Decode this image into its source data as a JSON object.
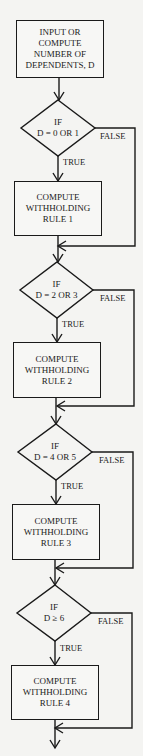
{
  "flowchart": {
    "start_box": {
      "lines": [
        "INPUT OR",
        "COMPUTE",
        "NUMBER OF",
        "DEPENDENTS, D"
      ]
    },
    "decisions": [
      {
        "line1": "IF",
        "line2": "D = 0 OR 1",
        "true_label": "TRUE",
        "false_label": "FALSE"
      },
      {
        "line1": "IF",
        "line2": "D = 2 OR 3",
        "true_label": "TRUE",
        "false_label": "FALSE"
      },
      {
        "line1": "IF",
        "line2": "D = 4 OR 5",
        "true_label": "TRUE",
        "false_label": "FALSE"
      },
      {
        "line1": "IF",
        "line2": "D ≥ 6",
        "true_label": "TRUE",
        "false_label": "FALSE"
      }
    ],
    "process_boxes": [
      {
        "lines": [
          "COMPUTE",
          "WITHHOLDING",
          "RULE 1"
        ]
      },
      {
        "lines": [
          "COMPUTE",
          "WITHHOLDING",
          "RULE 2"
        ]
      },
      {
        "lines": [
          "COMPUTE",
          "WITHHOLDING",
          "RULE 3"
        ]
      },
      {
        "lines": [
          "COMPUTE",
          "WITHHOLDING",
          "RULE 4"
        ]
      }
    ]
  }
}
